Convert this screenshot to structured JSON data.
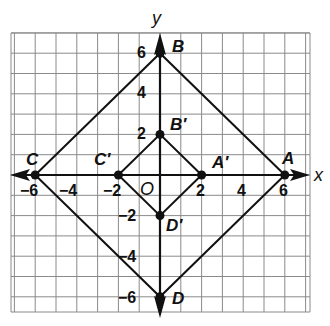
{
  "diagram": {
    "type": "coordinate-plane-dilation",
    "axes": {
      "x_label": "x",
      "y_label": "y",
      "origin_label": "O"
    },
    "x_ticks": [
      {
        "value": -6,
        "label": "−6"
      },
      {
        "value": -4,
        "label": "−4"
      },
      {
        "value": -2,
        "label": "−2"
      },
      {
        "value": 2,
        "label": "2"
      },
      {
        "value": 4,
        "label": "4"
      },
      {
        "value": 6,
        "label": "6"
      }
    ],
    "y_ticks": [
      {
        "value": 6,
        "label": "6"
      },
      {
        "value": 4,
        "label": "4"
      },
      {
        "value": 2,
        "label": "2"
      },
      {
        "value": -2,
        "label": "−2"
      },
      {
        "value": -4,
        "label": "−4"
      },
      {
        "value": -6,
        "label": "−6"
      }
    ],
    "outer_square": {
      "vertices": [
        {
          "name": "A",
          "label": "A",
          "x": 6,
          "y": 0
        },
        {
          "name": "B",
          "label": "B",
          "x": 0,
          "y": 6
        },
        {
          "name": "C",
          "label": "C",
          "x": -6,
          "y": 0
        },
        {
          "name": "D",
          "label": "D",
          "x": 0,
          "y": -6
        }
      ]
    },
    "inner_square": {
      "vertices": [
        {
          "name": "A'",
          "label": "A′",
          "x": 2,
          "y": 0
        },
        {
          "name": "B'",
          "label": "B′",
          "x": 0,
          "y": 2
        },
        {
          "name": "C'",
          "label": "C′",
          "x": -2,
          "y": 0
        },
        {
          "name": "D'",
          "label": "D′",
          "x": 0,
          "y": -2
        }
      ]
    },
    "colors": {
      "grid": "#8a8a8a",
      "lines": "#111111",
      "background": "#ffffff"
    }
  }
}
